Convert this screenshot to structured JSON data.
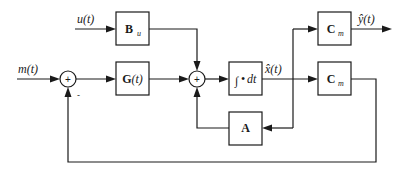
{
  "diagram": {
    "type": "block-diagram",
    "inputs": {
      "u": "u(t)",
      "m": "m(t)"
    },
    "outputs": {
      "y_hat": "ŷ(t)"
    },
    "signals": {
      "x_hat": "x̂(t)"
    },
    "blocks": {
      "bu": {
        "main": "B",
        "sub": "u"
      },
      "g": {
        "main": "G",
        "arg": "(t)"
      },
      "integrator": {
        "sym": "∫",
        "dot": "•",
        "dt": "dt"
      },
      "cm_top": {
        "main": "C",
        "sub": "m"
      },
      "cm_bottom": {
        "main": "C",
        "sub": "m"
      },
      "a": {
        "main": "A"
      }
    },
    "summing_junctions": {
      "sum1": {
        "sign_in": "+",
        "feedback_sign": "-"
      },
      "sum2": {
        "sign": "+"
      }
    },
    "connections": [
      "m(t) -> sum1",
      "sum1 -> G(t)",
      "G(t) -> sum2",
      "u(t) -> B_u",
      "B_u -> sum2",
      "sum2 -> integrator",
      "integrator -> x̂(t)",
      "x̂(t) -> C_m (top) -> ŷ(t)",
      "x̂(t) -> C_m (bottom) -> feedback -> sum1 (-)",
      "x̂(t) -> A -> sum2"
    ]
  }
}
